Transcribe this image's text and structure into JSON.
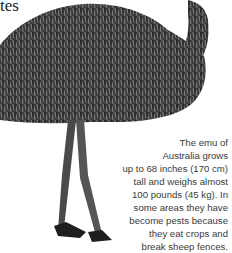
{
  "heading": {
    "fragment": "tes"
  },
  "image": {
    "subject": "emu-illustration",
    "description": "Grayscale photo of an emu with shaggy feathered body, long neck curving up at top right, and two long legs"
  },
  "caption": {
    "lines": [
      "The emu of",
      "Australia grows",
      "up to 68 inches (170 cm)",
      "tall and weighs almost",
      "100 pounds (45 kg). In",
      "some areas they have",
      "become pests because",
      "they eat crops and",
      "break sheep fences."
    ]
  }
}
